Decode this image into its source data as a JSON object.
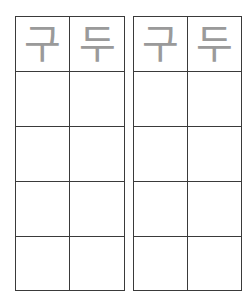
{
  "worksheet": {
    "grids": [
      {
        "headers": [
          "구",
          "두"
        ],
        "empty_rows": 4
      },
      {
        "headers": [
          "구",
          "두"
        ],
        "empty_rows": 4
      }
    ],
    "colors": {
      "line": "#3a3a3a",
      "trace_text": "#9a9a9a",
      "background": "#ffffff"
    }
  }
}
